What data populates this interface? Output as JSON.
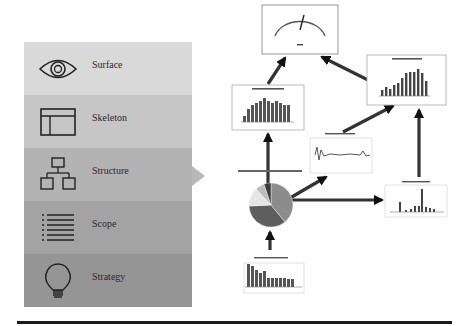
{
  "layers": [
    {
      "label": "Surface",
      "icon": "eye-icon",
      "color": "#d9d9d9"
    },
    {
      "label": "Skeleton",
      "icon": "wireframe-icon",
      "color": "#c6c6c6"
    },
    {
      "label": "Structure",
      "icon": "hierarchy-icon",
      "color": "#b3b3b3"
    },
    {
      "label": "Scope",
      "icon": "list-icon",
      "color": "#a3a3a3"
    },
    {
      "label": "Strategy",
      "icon": "lightbulb-icon",
      "color": "#959595"
    }
  ],
  "pointer": {
    "target_layer": "Structure"
  },
  "nodes": {
    "gauge": {
      "title": "Gauge"
    },
    "measured_head_count": {
      "title": "Measured Head Count",
      "values": [
        4,
        8,
        10,
        11,
        12,
        13,
        12,
        11,
        12,
        11,
        10,
        10
      ]
    },
    "performance_dashboard": {
      "title": "Performance Dashboard",
      "values": [
        3,
        5,
        4,
        6,
        7,
        10,
        13,
        14,
        14,
        16,
        13,
        9
      ]
    },
    "growth_in_headcount": {
      "title": "Growth in Headcount by Year"
    },
    "pie_distribution": {
      "title": "Distribution Pie Chart",
      "slices": [
        {
          "label": "A",
          "value": 45,
          "color": "#8c8c8c"
        },
        {
          "label": "B",
          "value": 33,
          "color": "#5e5e5e"
        },
        {
          "label": "C",
          "value": 12,
          "color": "#e6e6e6"
        },
        {
          "label": "D",
          "value": 6,
          "color": "#bdbdbd"
        },
        {
          "label": "E",
          "value": 4,
          "color": "#3c3c3c"
        }
      ]
    },
    "spend_value": {
      "title": "Spend Value by NWA",
      "values": [
        0,
        1,
        14,
        0,
        1,
        2,
        4,
        1,
        5,
        4,
        24,
        3,
        4,
        2,
        1
      ]
    },
    "workforce_headcount": {
      "title": "Workforce Headcount Allocation",
      "values": [
        16,
        15,
        12,
        10,
        11,
        6,
        6,
        6,
        6,
        6,
        5,
        5
      ]
    }
  }
}
